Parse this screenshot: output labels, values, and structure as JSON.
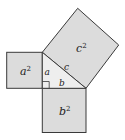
{
  "diagram": {
    "squares": {
      "a_square": {
        "label": "a",
        "exponent": "2"
      },
      "b_square": {
        "label": "b",
        "exponent": "2"
      },
      "c_square": {
        "label": "c",
        "exponent": "2"
      }
    },
    "triangle": {
      "side_a": "a",
      "side_b": "b",
      "side_c": "c",
      "right_angle_marker": true
    },
    "colors": {
      "square_fill": "#dcdcdc",
      "triangle_fill": "#eeeeee",
      "stroke": "#3a3a3a"
    }
  }
}
